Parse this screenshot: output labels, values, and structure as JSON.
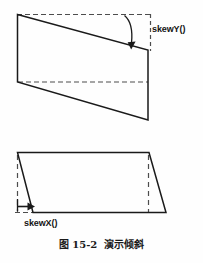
{
  "figure": {
    "caption_number": "图 15-2",
    "caption_title": "演示倾斜",
    "caption_full": "图 15-2  演示倾斜"
  },
  "labels": {
    "skew_y": "skewY()",
    "skew_x": "skewX()"
  },
  "colors": {
    "stroke": "#1a1a1a",
    "dashed_stroke": "#4d4d4d",
    "background": "#fefefe",
    "text": "#141414"
  },
  "diagram_data": {
    "type": "diagram",
    "description": "Two CSS transform skew illustrations: a skewY() parallelogram on top and a skewX() parallelogram on the bottom.",
    "shapes": [
      {
        "name": "skewy-parallelogram",
        "label": "skewY()",
        "kind": "solid-parallelogram",
        "points": [
          [
            17,
            14
          ],
          [
            148,
            50
          ],
          [
            148,
            120
          ],
          [
            17,
            82
          ]
        ],
        "reference_guides": [
          {
            "kind": "dashed-horizontal",
            "from": [
              17,
              14
            ],
            "to": [
              150,
              14
            ]
          },
          {
            "kind": "dashed-horizontal",
            "from": [
              17,
              82
            ],
            "to": [
              148,
              82
            ]
          },
          {
            "kind": "dashed-vertical",
            "from": [
              150,
              14
            ],
            "to": [
              150,
              50
            ]
          }
        ],
        "annotation_arrow": {
          "kind": "curved-down-arrow",
          "from": [
            131,
            16
          ],
          "to": [
            131,
            47
          ]
        }
      },
      {
        "name": "skewx-parallelogram",
        "label": "skewX()",
        "kind": "solid-parallelogram",
        "points": [
          [
            17,
            152
          ],
          [
            149,
            152
          ],
          [
            166,
            213
          ],
          [
            33,
            213
          ]
        ],
        "reference_guides": [
          {
            "kind": "dashed-vertical",
            "from": [
              17,
              155
            ],
            "to": [
              17,
              213
            ]
          },
          {
            "kind": "dashed-vertical",
            "from": [
              149,
              155
            ],
            "to": [
              149,
              213
            ]
          },
          {
            "kind": "dashed-horizontal",
            "from": [
              17,
              213
            ],
            "to": [
              33,
              213
            ]
          }
        ],
        "annotation_arrow": {
          "kind": "straight-right-arrow",
          "from": [
            17,
            207
          ],
          "to": [
            34,
            207
          ]
        }
      }
    ]
  }
}
